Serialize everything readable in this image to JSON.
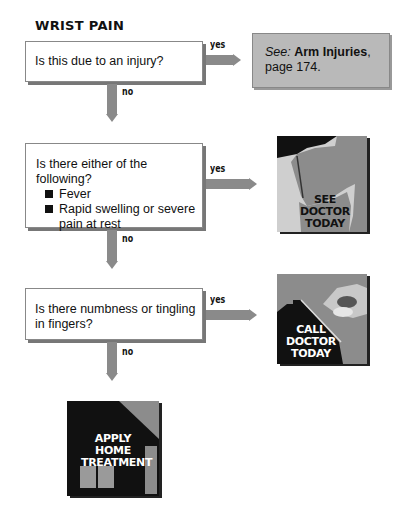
{
  "title": "WRIST PAIN",
  "questions": [
    {
      "text": "Is this due to an injury?",
      "yes_label": "yes",
      "no_label": "no"
    },
    {
      "text": "Is there either of the following?",
      "bullets": [
        "Fever",
        "Rapid swelling or severe pain at rest"
      ],
      "yes_label": "yes",
      "no_label": "no"
    },
    {
      "text": "Is there numbness or tingling in fingers?",
      "yes_label": "yes",
      "no_label": "no"
    }
  ],
  "see_box": {
    "prefix": "See:",
    "link": "Arm Injuries",
    "suffix": ",",
    "page": "page 174."
  },
  "outcomes": {
    "see_doctor": [
      "SEE",
      "DOCTOR",
      "TODAY"
    ],
    "call_doctor": [
      "CALL",
      "DOCTOR",
      "TODAY"
    ],
    "home_treatment": [
      "APPLY",
      "HOME",
      "TREATMENT"
    ]
  },
  "colors": {
    "arrow": "#8a8a8a",
    "see_box": "#b9b9b9",
    "icon_dark": "#111111",
    "icon_mid": "#8c8c8c",
    "icon_light": "#c8c8c8"
  }
}
